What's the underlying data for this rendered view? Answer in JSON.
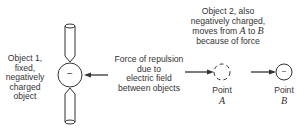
{
  "object1": {
    "lines": [
      "Object 1,",
      "fixed,",
      "negatively",
      "charged",
      "object"
    ],
    "charge_sign": "−"
  },
  "force": {
    "lines": [
      "Force of repulsion",
      "due to",
      "electric field",
      "between objects"
    ]
  },
  "object2": {
    "lines": [
      "Object 2, also",
      "negatively charged,"
    ],
    "line3_pre": "moves from ",
    "line3_a": "A",
    "line3_mid": " to ",
    "line3_b": "B",
    "line4": "because of force"
  },
  "pointA": {
    "word": "Point",
    "letter": "A"
  },
  "pointB": {
    "word": "Point",
    "letter": "B",
    "charge_sign": "−"
  }
}
